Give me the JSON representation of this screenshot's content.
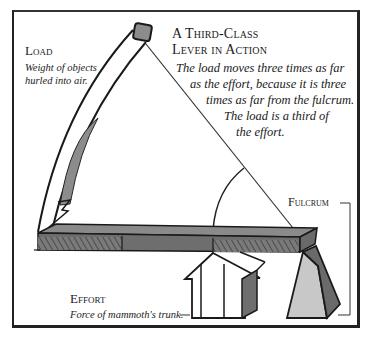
{
  "diagram": {
    "title_line1": "A Third-Class",
    "title_line2": "Lever in Action",
    "description_lines": [
      "The load moves three times as far",
      "as the effort, because it is three",
      "times as far from the fulcrum.",
      "The load is a third of",
      "the effort."
    ],
    "labels": {
      "load": {
        "heading": "Load",
        "sub_line1": "Weight of objects",
        "sub_line2": "hurled into air."
      },
      "effort": {
        "heading": "Effort",
        "sub": "Force of mammoth's trunk."
      },
      "fulcrum": {
        "heading": "Fulcrum"
      }
    },
    "colors": {
      "beam": "#6e6e6e",
      "beam_top": "#8a8a8a",
      "fulcrum_light": "#c8c8c8",
      "fulcrum_dark": "#6a6a6a",
      "load_block": "#8c8c8c",
      "line": "#1a1a1a"
    }
  }
}
